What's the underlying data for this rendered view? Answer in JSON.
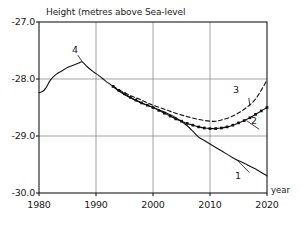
{
  "chart_data": {
    "type": "line",
    "title": "Height (metres above Sea-level",
    "xlabel": "year",
    "ylabel": "",
    "xlim": [
      1980,
      2020
    ],
    "ylim": [
      -30.0,
      -27.0
    ],
    "grid": true,
    "legend_position": "inline-annotations",
    "xticks": [
      "1980",
      "1990",
      "2000",
      "2010",
      "2020"
    ],
    "xtick_values": [
      1980,
      1990,
      2000,
      2010,
      2020
    ],
    "yticks": [
      "-27.0",
      "-28.0",
      "-29.0",
      "-30.0"
    ],
    "ytick_values": [
      -27.0,
      -28.0,
      -29.0,
      -30.0
    ],
    "series": [
      {
        "name": "1",
        "label": "1",
        "style": "solid",
        "marker": "none",
        "x": [
          1993,
          1994,
          1996,
          1998,
          2000,
          2002,
          2004,
          2006,
          2007,
          2008,
          2009,
          2010,
          2012,
          2014,
          2016,
          2018,
          2020
        ],
        "values": [
          -28.13,
          -28.21,
          -28.33,
          -28.42,
          -28.5,
          -28.58,
          -28.68,
          -28.82,
          -28.92,
          -29.02,
          -29.08,
          -29.14,
          -29.26,
          -29.38,
          -29.48,
          -29.58,
          -29.7
        ]
      },
      {
        "name": "2",
        "label": "2",
        "style": "solid",
        "marker": "filled-square",
        "x": [
          1993,
          1994,
          1995,
          1996,
          1997,
          1998,
          1999,
          2000,
          2001,
          2002,
          2003,
          2004,
          2005,
          2006,
          2007,
          2008,
          2009,
          2010,
          2011,
          2012,
          2013,
          2014,
          2015,
          2016,
          2017,
          2018,
          2019,
          2020
        ],
        "values": [
          -28.13,
          -28.2,
          -28.26,
          -28.32,
          -28.37,
          -28.42,
          -28.46,
          -28.5,
          -28.55,
          -28.6,
          -28.65,
          -28.7,
          -28.74,
          -28.78,
          -28.81,
          -28.84,
          -28.86,
          -28.87,
          -28.87,
          -28.86,
          -28.84,
          -28.81,
          -28.77,
          -28.73,
          -28.68,
          -28.62,
          -28.56,
          -28.5
        ]
      },
      {
        "name": "3",
        "label": "3",
        "style": "dashed",
        "marker": "none",
        "x": [
          1993,
          1994,
          1995,
          1996,
          1997,
          1998,
          1999,
          2000,
          2002,
          2004,
          2006,
          2008,
          2010,
          2011,
          2012,
          2014,
          2016,
          2018,
          2020
        ],
        "values": [
          -28.13,
          -28.19,
          -28.24,
          -28.29,
          -28.33,
          -28.37,
          -28.42,
          -28.46,
          -28.53,
          -28.6,
          -28.66,
          -28.71,
          -28.74,
          -28.74,
          -28.72,
          -28.65,
          -28.53,
          -28.35,
          -28.02
        ]
      },
      {
        "name": "4",
        "label": "4",
        "style": "solid",
        "marker": "none",
        "x": [
          1980,
          1980.6,
          1981.2,
          1982,
          1983,
          1984,
          1985,
          1986,
          1987,
          1987.6,
          1988.5,
          1989.5,
          1990.5,
          1991.5,
          1992,
          1993
        ],
        "values": [
          -28.24,
          -28.22,
          -28.16,
          -28.02,
          -27.92,
          -27.86,
          -27.8,
          -27.76,
          -27.72,
          -27.7,
          -27.79,
          -27.87,
          -27.94,
          -28.02,
          -28.06,
          -28.13
        ]
      }
    ],
    "annotations": [
      {
        "label": "4",
        "x": 1986.2,
        "y": -27.52,
        "leader_to_x": 1987.6,
        "leader_to_y": -27.7
      },
      {
        "label": "3",
        "x": 2016.2,
        "y": -28.27,
        "leader_to_x": 2017.0,
        "leader_to_y": -28.48
      },
      {
        "label": "2",
        "x": 2018.0,
        "y": -28.82,
        "leader_to_x": 2016.4,
        "leader_to_y": -28.73
      },
      {
        "label": "1",
        "x": 2016.3,
        "y": -29.58,
        "leader_to_x": 2014.6,
        "leader_to_y": -29.41
      }
    ]
  },
  "colors": {
    "axis": "#1a1a1a",
    "grid": "#7d7d7d",
    "series": "#111111",
    "background": "#ffffff"
  }
}
